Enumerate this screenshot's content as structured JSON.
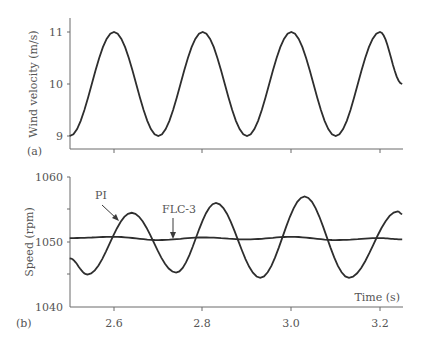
{
  "chart_data": [
    {
      "type": "line",
      "panel": "(a)",
      "title": "",
      "xlabel": "",
      "ylabel": "Wind velocity (m/s)",
      "xlim": [
        2.5,
        3.25
      ],
      "ylim": [
        8.75,
        11.25
      ],
      "yticks": [
        9,
        10,
        11
      ],
      "xticks": [
        2.6,
        2.8,
        3.0,
        3.2
      ],
      "grid": false,
      "series": [
        {
          "name": "Wind velocity",
          "x": [
            2.5,
            2.55,
            2.6,
            2.65,
            2.7,
            2.75,
            2.8,
            2.85,
            2.9,
            2.95,
            3.0,
            3.05,
            3.1,
            3.15,
            3.2,
            3.25
          ],
          "values": [
            9.0,
            10.0,
            11.0,
            10.0,
            9.0,
            10.0,
            11.0,
            10.0,
            9.0,
            10.0,
            11.0,
            10.0,
            9.0,
            10.0,
            11.0,
            10.0
          ]
        }
      ]
    },
    {
      "type": "line",
      "panel": "(b)",
      "title": "",
      "xlabel": "Time (s)",
      "ylabel": "Speed (rpm)",
      "xlim": [
        2.5,
        3.25
      ],
      "ylim": [
        1040,
        1060
      ],
      "yticks": [
        1040,
        1050,
        1060
      ],
      "xticks": [
        2.6,
        2.8,
        3.0,
        3.2
      ],
      "xtick_labels": [
        "2.6",
        "2.8",
        "3.0",
        "3.2"
      ],
      "grid": false,
      "annotations": [
        {
          "text": "PI",
          "points_to": "PI curve near t=2.62"
        },
        {
          "text": "FLC-3",
          "points_to": "FLC-3 curve near t=2.74"
        }
      ],
      "series": [
        {
          "name": "PI",
          "x": [
            2.5,
            2.54,
            2.59,
            2.64,
            2.69,
            2.74,
            2.79,
            2.83,
            2.88,
            2.93,
            2.98,
            3.03,
            3.08,
            3.13,
            3.18,
            3.24,
            3.25
          ],
          "values": [
            1047.5,
            1045.0,
            1050.0,
            1054.5,
            1050.0,
            1045.3,
            1050.0,
            1056.0,
            1050.0,
            1044.5,
            1050.5,
            1057.0,
            1050.0,
            1044.5,
            1050.0,
            1054.7,
            1054.3
          ]
        },
        {
          "name": "FLC-3",
          "x": [
            2.5,
            2.6,
            2.7,
            2.8,
            2.9,
            3.0,
            3.1,
            3.2,
            3.25
          ],
          "values": [
            1050.6,
            1050.8,
            1050.3,
            1050.7,
            1050.4,
            1050.8,
            1050.3,
            1050.6,
            1050.4
          ]
        }
      ]
    }
  ],
  "panel_a": {
    "label": "(a)",
    "ylabel": "Wind velocity (m/s)",
    "yticks": [
      "11",
      "10",
      "9"
    ]
  },
  "panel_b": {
    "label": "(b)",
    "ylabel": "Speed (rpm)",
    "xlabel": "Time (s)",
    "yticks": [
      "1060",
      "1050",
      "1040"
    ],
    "xticks": [
      "2.6",
      "2.8",
      "3.0",
      "3.2"
    ],
    "annotation_pi": "PI",
    "annotation_flc": "FLC-3"
  },
  "colors": {
    "curve": "#2e2e2e",
    "axis": "#6a6a6a",
    "text": "#555555"
  }
}
